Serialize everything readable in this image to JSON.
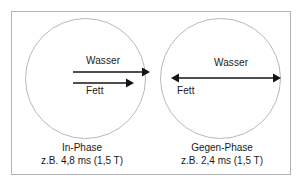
{
  "figure": {
    "colors": {
      "frame_stroke": "#b3b3b3",
      "circle_stroke": "#b8b8b8",
      "arrow": "#141414",
      "text": "#1a1a1a",
      "background": "#ffffff"
    },
    "panels": [
      {
        "id": "in-phase",
        "caption_title": "In-Phase",
        "caption_subtitle": "z.B. 4,8 ms (1,5 T)",
        "arrows": [
          {
            "name": "wasser",
            "label": "Wasser",
            "direction": "right",
            "relative_length": 1.0
          },
          {
            "name": "fett",
            "label": "Fett",
            "direction": "right",
            "relative_length": 0.78
          }
        ]
      },
      {
        "id": "gegen-phase",
        "caption_title": "Gegen-Phase",
        "caption_subtitle": "z.B. 2,4 ms (1,5 T)",
        "arrows": [
          {
            "name": "wasser",
            "label": "Wasser",
            "direction": "right",
            "relative_length": 1.0
          },
          {
            "name": "fett",
            "label": "Fett",
            "direction": "left",
            "relative_length": 1.0
          }
        ]
      }
    ]
  }
}
